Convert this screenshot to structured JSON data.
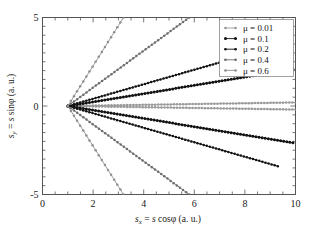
{
  "chart_data": {
    "type": "line",
    "title": "",
    "subtitle": "",
    "xlabel": "s_x = s cosφ  (a. u.)",
    "ylabel": "s_y = s sinφ  (a. u.)",
    "xlim": [
      0,
      10
    ],
    "ylim": [
      -5,
      5
    ],
    "xticks": [
      0,
      2,
      4,
      6,
      8,
      10
    ],
    "yticks": [
      -5,
      0,
      5
    ],
    "xtick_labels": [
      "0",
      "2",
      "4",
      "6",
      "8",
      "10"
    ],
    "ytick_labels": [
      "-5",
      "0",
      "5"
    ],
    "xminor_step": 0.5,
    "yminor_step": 0.5,
    "grid": false,
    "legend_position": "top-right",
    "focus_point": [
      1.0,
      0.0
    ],
    "series": [
      {
        "name": "μ = 0.01",
        "mu": 0.01,
        "color": "#9a9a9a",
        "marker": "star",
        "slope": 0.0222,
        "x": [
          1.0,
          1.5,
          2.0,
          2.5,
          3.0,
          3.5,
          4.0,
          4.5,
          5.0,
          5.5,
          6.0,
          6.5,
          7.0,
          7.5,
          8.0,
          8.5,
          9.0,
          9.5,
          10.0
        ],
        "y_upper": [
          0.0,
          0.011,
          0.022,
          0.033,
          0.044,
          0.056,
          0.067,
          0.078,
          0.089,
          0.1,
          0.111,
          0.122,
          0.133,
          0.144,
          0.156,
          0.167,
          0.178,
          0.189,
          0.2
        ],
        "y_lower": [
          0.0,
          -0.011,
          -0.022,
          -0.033,
          -0.044,
          -0.056,
          -0.067,
          -0.078,
          -0.089,
          -0.1,
          -0.111,
          -0.122,
          -0.133,
          -0.144,
          -0.156,
          -0.167,
          -0.178,
          -0.189,
          -0.2
        ]
      },
      {
        "name": "μ = 0.1",
        "mu": 0.1,
        "color": "#111111",
        "marker": "filled-circle",
        "slope": 0.233,
        "x": [
          1.0,
          1.5,
          2.0,
          2.5,
          3.0,
          3.5,
          4.0,
          4.5,
          5.0,
          5.5,
          6.0,
          6.5,
          7.0,
          7.5,
          8.0,
          8.5,
          9.0,
          9.5,
          9.9
        ],
        "y_upper": [
          0.0,
          0.117,
          0.233,
          0.35,
          0.467,
          0.583,
          0.7,
          0.817,
          0.933,
          1.05,
          1.167,
          1.283,
          1.4,
          1.517,
          1.633,
          1.75,
          1.867,
          1.983,
          2.077
        ],
        "y_lower": [
          0.0,
          -0.117,
          -0.233,
          -0.35,
          -0.467,
          -0.583,
          -0.7,
          -0.817,
          -0.933,
          -1.05,
          -1.167,
          -1.283,
          -1.4,
          -1.517,
          -1.633,
          -1.75,
          -1.867,
          -1.983,
          -2.077
        ]
      },
      {
        "name": "μ = 0.2",
        "mu": 0.2,
        "color": "#111111",
        "marker": "star",
        "slope": 0.41,
        "x": [
          1.0,
          1.5,
          2.0,
          2.5,
          3.0,
          3.5,
          4.0,
          4.5,
          5.0,
          5.5,
          6.0,
          6.5,
          7.0,
          7.5,
          8.0,
          8.5,
          9.0,
          9.3
        ],
        "y_upper": [
          0.0,
          0.205,
          0.41,
          0.615,
          0.82,
          1.025,
          1.23,
          1.435,
          1.64,
          1.845,
          2.05,
          2.255,
          2.46,
          2.665,
          2.87,
          3.075,
          3.28,
          3.4
        ],
        "y_lower": [
          0.0,
          -0.205,
          -0.41,
          -0.615,
          -0.82,
          -1.025,
          -1.23,
          -1.435,
          -1.64,
          -1.845,
          -2.05,
          -2.255,
          -2.46,
          -2.665,
          -2.87,
          -3.075,
          -3.28,
          -3.4
        ]
      },
      {
        "name": "μ = 0.4",
        "mu": 0.4,
        "color": "#6e6e6e",
        "marker": "star",
        "slope": 1.04,
        "x": [
          1.0,
          1.5,
          2.0,
          2.5,
          3.0,
          3.5,
          4.0,
          4.5,
          5.0,
          5.5,
          5.8
        ],
        "y_upper": [
          0.0,
          0.52,
          1.04,
          1.56,
          2.08,
          2.6,
          3.12,
          3.64,
          4.16,
          4.68,
          5.0
        ],
        "y_lower": [
          0.0,
          -0.52,
          -1.04,
          -1.56,
          -2.08,
          -2.6,
          -3.12,
          -3.64,
          -4.16,
          -4.68,
          -5.0
        ]
      },
      {
        "name": "μ = 0.6",
        "mu": 0.6,
        "color": "#8f8f8f",
        "marker": "star",
        "slope": 2.27,
        "x": [
          1.0,
          1.3,
          1.6,
          1.9,
          2.2,
          2.5,
          2.8,
          3.0,
          3.2
        ],
        "y_upper": [
          0.0,
          0.68,
          1.36,
          2.04,
          2.72,
          3.41,
          4.09,
          4.54,
          5.0
        ],
        "y_lower": [
          0.0,
          -0.68,
          -1.36,
          -2.04,
          -2.72,
          -3.41,
          -4.09,
          -4.54,
          -5.0
        ]
      }
    ],
    "legend_entries": [
      {
        "label": "μ = 0.01"
      },
      {
        "label": "μ = 0.1"
      },
      {
        "label": "μ = 0.2"
      },
      {
        "label": "μ = 0.4"
      },
      {
        "label": "μ = 0.6"
      }
    ]
  },
  "axes": {
    "x_label_parts": {
      "s": "s",
      "sub": "x",
      "eq": "= s cosφ",
      "units": "(a. u.)"
    },
    "y_label_parts": {
      "s": "s",
      "sub": "y",
      "eq": "= s sinφ",
      "units": "(a. u.)"
    }
  }
}
